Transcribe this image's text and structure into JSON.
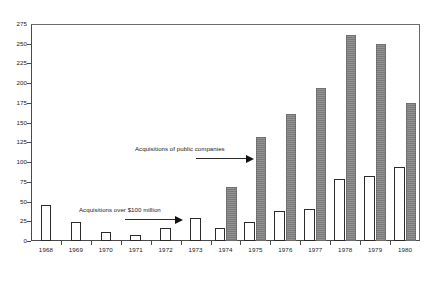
{
  "chart_data": {
    "type": "bar",
    "title": "",
    "subtitle": "",
    "xlabel": "",
    "ylabel": "",
    "ylim": [
      0,
      275
    ],
    "ytick_step": 25,
    "yticks": [
      0,
      25,
      50,
      75,
      100,
      125,
      150,
      175,
      200,
      225,
      250,
      275
    ],
    "ytick_labels": [
      "0",
      "25",
      "50",
      "75",
      "100",
      "125",
      "150",
      "175",
      "200",
      "225",
      "250",
      "275"
    ],
    "grid": false,
    "legend": "none",
    "categories": [
      "1968",
      "1969",
      "1970",
      "1971",
      "1972",
      "1973",
      "1974",
      "1975",
      "1976",
      "1977",
      "1978",
      "1979",
      "1980"
    ],
    "series": [
      {
        "name": "Acquisitions over $100 million",
        "style": "white-outline",
        "color": "#ffffff",
        "edge_color": "#2b2b2b",
        "values": [
          46,
          24,
          11,
          7,
          16,
          29,
          17,
          24,
          38,
          40,
          79,
          83,
          94
        ]
      },
      {
        "name": "Acquisitions of public companies",
        "style": "gray-filled",
        "color": "#808080",
        "edge_color": "#707070",
        "values": [
          null,
          null,
          null,
          null,
          null,
          null,
          69,
          132,
          161,
          194,
          261,
          250,
          175
        ]
      }
    ],
    "annotations": [
      {
        "id": "annotation-public-companies",
        "text": "Acquisitions of public companies",
        "text_x": 135,
        "text_y": 145,
        "arrow_x": 196,
        "arrow_y": 158,
        "arrow_length": 50
      },
      {
        "id": "annotation-over-100-million",
        "text": "Acquisitions over $100 million",
        "text_x": 79,
        "text_y": 206,
        "arrow_x": 125,
        "arrow_y": 219,
        "arrow_length": 50
      }
    ]
  }
}
